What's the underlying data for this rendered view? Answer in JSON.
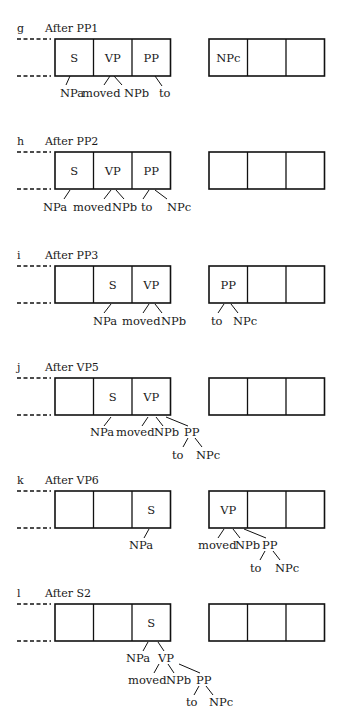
{
  "figure": {
    "width": 344,
    "height": 721,
    "colors": {
      "ink": "#111111",
      "background": "#ffffff"
    },
    "box_geometry": {
      "left_box_x": 55,
      "right_box_x": 209,
      "cell_width": 38.5,
      "cells_per_box": 3,
      "box_height": 37,
      "dash_x1": 17,
      "dash_x2": 51
    },
    "panels": [
      {
        "letter": "g",
        "title": "After PP1",
        "box_top": 39,
        "left_cells": [
          "S",
          "VP",
          "PP"
        ],
        "right_cells": [
          "NPc",
          "",
          ""
        ],
        "branches": [
          [
            70,
            76,
            66,
            85
          ],
          [
            110,
            76,
            104,
            85
          ],
          [
            114,
            76,
            122,
            85
          ],
          [
            155,
            76,
            162,
            86
          ]
        ],
        "leaves": [
          {
            "text": "NPa",
            "x": 60,
            "y": 97
          },
          {
            "text": "moved",
            "x": 82,
            "y": 97
          },
          {
            "text": "NPb",
            "x": 124,
            "y": 97
          },
          {
            "text": "to",
            "x": 159,
            "y": 97
          }
        ]
      },
      {
        "letter": "h",
        "title": "After PP2",
        "box_top": 152,
        "left_cells": [
          "S",
          "VP",
          "PP"
        ],
        "right_cells": [
          "",
          "",
          ""
        ],
        "branches": [
          [
            70,
            190,
            64,
            199
          ],
          [
            111,
            190,
            104,
            199
          ],
          [
            116,
            190,
            124,
            199
          ],
          [
            149,
            190,
            143,
            199
          ],
          [
            155,
            190,
            167,
            199
          ]
        ],
        "leaves": [
          {
            "text": "NPa",
            "x": 43,
            "y": 211
          },
          {
            "text": "moved",
            "x": 73,
            "y": 211
          },
          {
            "text": "NPb",
            "x": 112,
            "y": 211
          },
          {
            "text": "to",
            "x": 141,
            "y": 211
          },
          {
            "text": "NPc",
            "x": 167,
            "y": 211
          }
        ]
      },
      {
        "letter": "i",
        "title": "After PP3",
        "box_top": 266,
        "left_cells": [
          "",
          "S",
          "VP"
        ],
        "right_cells": [
          "PP",
          "",
          ""
        ],
        "branches": [
          [
            111,
            304,
            104,
            313
          ],
          [
            149,
            304,
            143,
            313
          ],
          [
            155,
            304,
            162,
            313
          ],
          [
            224,
            304,
            218,
            313
          ],
          [
            231,
            304,
            238,
            313
          ]
        ],
        "leaves": [
          {
            "text": "NPa",
            "x": 93,
            "y": 325
          },
          {
            "text": "moved",
            "x": 122,
            "y": 325
          },
          {
            "text": "NPb",
            "x": 161,
            "y": 325
          },
          {
            "text": "to",
            "x": 211,
            "y": 325
          },
          {
            "text": "NPc",
            "x": 233,
            "y": 325
          }
        ]
      },
      {
        "letter": "j",
        "title": "After VP5",
        "box_top": 378,
        "left_cells": [
          "",
          "S",
          "VP"
        ],
        "right_cells": [
          "",
          "",
          ""
        ],
        "branches": [
          [
            111,
            417,
            104,
            426
          ],
          [
            148,
            417,
            142,
            426
          ],
          [
            156,
            417,
            163,
            426
          ],
          [
            166,
            417,
            188,
            426
          ],
          [
            188,
            438,
            183,
            447
          ],
          [
            195,
            438,
            202,
            447
          ]
        ],
        "leaves": [
          {
            "text": "NPa",
            "x": 90,
            "y": 436
          },
          {
            "text": "moved",
            "x": 116,
            "y": 436
          },
          {
            "text": "NPb",
            "x": 154,
            "y": 436
          },
          {
            "text": "PP",
            "x": 184,
            "y": 436
          },
          {
            "text": "to",
            "x": 172,
            "y": 459
          },
          {
            "text": "NPc",
            "x": 196,
            "y": 459
          }
        ]
      },
      {
        "letter": "k",
        "title": "After VP6",
        "box_top": 491,
        "left_cells": [
          "",
          "",
          "S"
        ],
        "right_cells": [
          "VP",
          "",
          ""
        ],
        "branches": [
          [
            149,
            529,
            144,
            538
          ],
          [
            224,
            529,
            218,
            538
          ],
          [
            233,
            529,
            240,
            538
          ],
          [
            244,
            529,
            266,
            538
          ],
          [
            265,
            551,
            260,
            560
          ],
          [
            273,
            551,
            280,
            560
          ]
        ],
        "leaves": [
          {
            "text": "NPa",
            "x": 129,
            "y": 549
          },
          {
            "text": "moved",
            "x": 198,
            "y": 549
          },
          {
            "text": "NPb",
            "x": 235,
            "y": 549
          },
          {
            "text": "PP",
            "x": 262,
            "y": 549
          },
          {
            "text": "to",
            "x": 250,
            "y": 572
          },
          {
            "text": "NPc",
            "x": 275,
            "y": 572
          }
        ]
      },
      {
        "letter": "l",
        "title": "After S2",
        "box_top": 604,
        "left_cells": [
          "",
          "",
          "S"
        ],
        "right_cells": [
          "",
          "",
          ""
        ],
        "branches": [
          [
            148,
            642,
            143,
            651
          ],
          [
            158,
            642,
            164,
            651
          ],
          [
            159,
            664,
            154,
            673
          ],
          [
            168,
            664,
            174,
            673
          ],
          [
            179,
            664,
            200,
            673
          ],
          [
            199,
            686,
            194,
            695
          ],
          [
            206,
            686,
            213,
            695
          ]
        ],
        "leaves": [
          {
            "text": "NPa",
            "x": 126,
            "y": 662
          },
          {
            "text": "VP",
            "x": 158,
            "y": 662
          },
          {
            "text": "moved",
            "x": 128,
            "y": 684
          },
          {
            "text": "NPb",
            "x": 166,
            "y": 684
          },
          {
            "text": "PP",
            "x": 196,
            "y": 684
          },
          {
            "text": "to",
            "x": 186,
            "y": 706
          },
          {
            "text": "NPc",
            "x": 209,
            "y": 706
          }
        ]
      }
    ]
  }
}
